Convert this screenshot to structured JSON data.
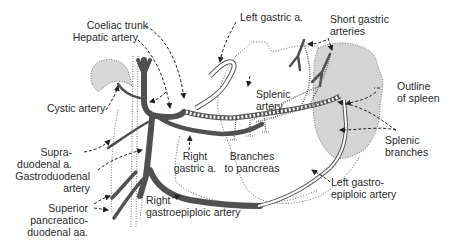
{
  "diagram": {
    "colors": {
      "artery": "#505050",
      "spleen_fill": "#d4d4d4",
      "gallbladder_fill": "#d8d8d8",
      "outline": "#555555",
      "label": "#2a2a2a"
    },
    "labels": {
      "coeliac_trunk": "Coeliac trunk",
      "hepatic_artery": "Hepatic artery",
      "left_gastric": "Left gastric a.",
      "short_gastric_1": "Short gastric",
      "short_gastric_2": "arteries",
      "outline_spleen_1": "Outline",
      "outline_spleen_2": "of spleen",
      "cystic_artery": "Cystic artery",
      "splenic_artery_1": "Splenic",
      "splenic_artery_2": "artery",
      "splenic_branches_1": "Splenic",
      "splenic_branches_2": "branches",
      "supraduodenal_1": "Supra-",
      "supraduodenal_2": "duodenal a.",
      "gastroduodenal_1": "Gastroduodenal",
      "gastroduodenal_2": "artery",
      "right_gastric_1": "Right",
      "right_gastric_2": "gastric a.",
      "branches_pancreas_1": "Branches",
      "branches_pancreas_2": "to pancreas",
      "left_gastroepiploic_1": "Left gastro-",
      "left_gastroepiploic_2": "epiploic artery",
      "right_gastroepiploic_1": "Right",
      "right_gastroepiploic_2": "gastroepiploic artery",
      "sup_pancreatico_1": "Superior",
      "sup_pancreatico_2": "pancreatico-",
      "sup_pancreatico_3": "duodenal aa."
    }
  }
}
